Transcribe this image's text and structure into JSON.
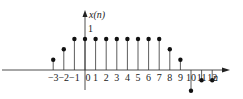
{
  "chart_data": {
    "type": "stem",
    "title": "",
    "ylabel": "x(n)",
    "xlabel": "n",
    "y_tick_label": "1",
    "x": [
      -3,
      -2,
      -1,
      0,
      1,
      2,
      3,
      4,
      5,
      6,
      7,
      8,
      9,
      10,
      11,
      12
    ],
    "values": [
      0.33,
      0.67,
      1,
      1,
      1,
      1,
      1,
      1,
      1,
      1,
      1,
      0.67,
      0.33,
      -0.67,
      -0.33,
      -0.33
    ],
    "tick_labels": [
      "-3",
      "-2",
      "-1",
      "0",
      "1",
      "2",
      "3",
      "4",
      "5",
      "6",
      "7",
      "8",
      "9",
      "10",
      "11",
      "12"
    ],
    "grid": false,
    "legend": null,
    "colors": {
      "stroke": "#222222",
      "background": "#ffffff"
    }
  }
}
